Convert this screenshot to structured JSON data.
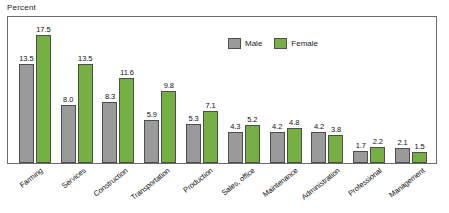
{
  "chart_data": {
    "type": "bar",
    "title": "",
    "subtitle": "",
    "xlabel": "",
    "ylabel": "Percent",
    "ylim": [
      0,
      18.5
    ],
    "grid": false,
    "legend_position": "top-right",
    "categories": [
      "Farming",
      "Services",
      "Construction",
      "Transportation",
      "Production",
      "Sales, office",
      "Maintenance",
      "Administration",
      "Professional",
      "Management"
    ],
    "series": [
      {
        "name": "Male",
        "color": "#9a9a9a",
        "values": [
          13.5,
          8.0,
          8.3,
          5.9,
          5.3,
          4.3,
          4.2,
          4.2,
          1.7,
          2.1
        ],
        "labels": [
          "13.5",
          "8.0",
          "8.3",
          "5.9",
          "5.3",
          "4.3",
          "4.2",
          "4.2",
          "1.7",
          "2.1"
        ]
      },
      {
        "name": "Female",
        "color": "#76b045",
        "values": [
          17.5,
          13.5,
          11.6,
          9.8,
          7.1,
          5.2,
          4.8,
          3.8,
          2.2,
          1.5
        ],
        "labels": [
          "17.5",
          "13.5",
          "11.6",
          "9.8",
          "7.1",
          "5.2",
          "4.8",
          "3.8",
          "2.2",
          "1.5"
        ]
      }
    ]
  },
  "legend": {
    "items": [
      {
        "label": "Male",
        "color": "#9a9a9a"
      },
      {
        "label": "Female",
        "color": "#76b045"
      }
    ]
  },
  "axis": {
    "y_title": "Percent"
  }
}
